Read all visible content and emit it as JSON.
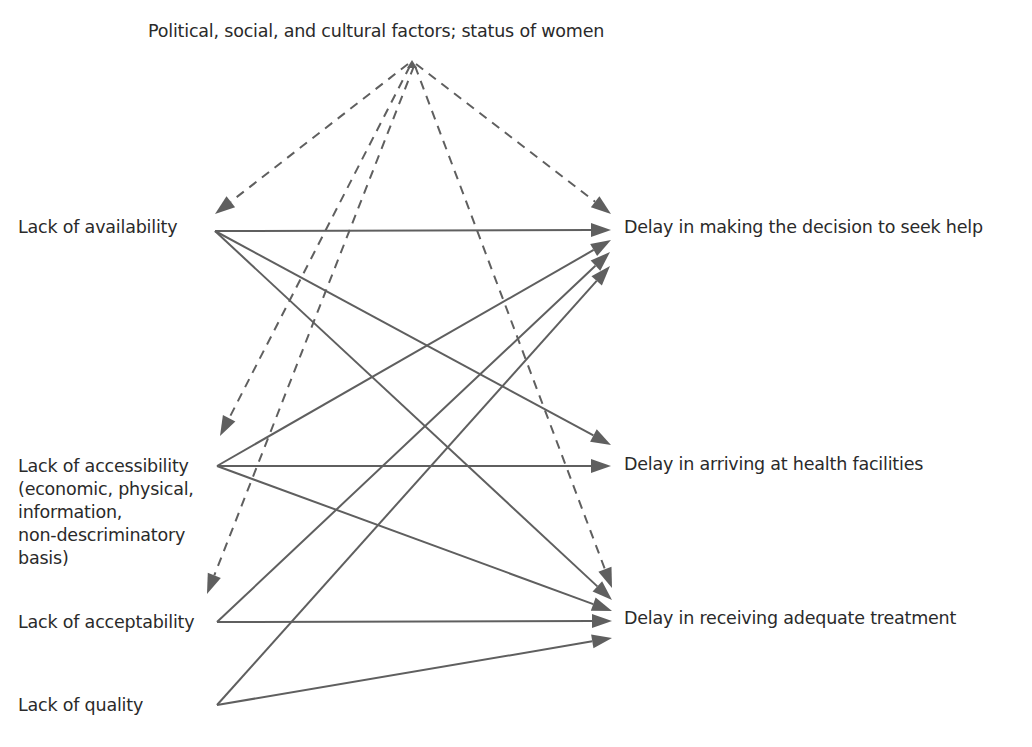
{
  "diagram": {
    "colors": {
      "edge": "#5f5f5f",
      "text": "#2a2a2a",
      "background": "#ffffff"
    },
    "top": {
      "id": "factors",
      "label": "Political, social, and cultural factors; status of women",
      "x": 148,
      "y": 20,
      "anchor": [
        412,
        62
      ]
    },
    "left_nodes": [
      {
        "id": "availability",
        "label": "Lack of availability",
        "x": 18,
        "y": 216,
        "anchor": [
          215,
          231
        ]
      },
      {
        "id": "accessibility",
        "label": "Lack of accessibility\n(economic, physical,\ninformation,\nnon-descriminatory\nbasis)",
        "x": 18,
        "y": 455,
        "anchor": [
          217,
          466
        ]
      },
      {
        "id": "acceptability",
        "label": "Lack of acceptability",
        "x": 18,
        "y": 611,
        "anchor": [
          217,
          622
        ]
      },
      {
        "id": "quality",
        "label": "Lack of quality",
        "x": 18,
        "y": 694,
        "anchor": [
          217,
          705
        ]
      }
    ],
    "right_nodes": [
      {
        "id": "decision",
        "label": "Delay in making the decision to seek help",
        "x": 624,
        "y": 216
      },
      {
        "id": "arrival",
        "label": "Delay in arriving at health facilities",
        "x": 624,
        "y": 453
      },
      {
        "id": "treatment",
        "label": "Delay in receiving adequate treatment",
        "x": 624,
        "y": 607
      }
    ],
    "edges": [
      {
        "from": "factors",
        "to": "availability",
        "style": "dashed",
        "p1": [
          408,
          64
        ],
        "p2": [
          215,
          214
        ]
      },
      {
        "from": "factors",
        "to": "accessibility",
        "style": "dashed",
        "p1": [
          410,
          66
        ],
        "p2": [
          220,
          436
        ]
      },
      {
        "from": "factors",
        "to": "acceptability",
        "style": "dashed",
        "p1": [
          414,
          66
        ],
        "p2": [
          207,
          594
        ]
      },
      {
        "from": "factors",
        "to": "decision",
        "style": "dashed",
        "p1": [
          416,
          64
        ],
        "p2": [
          611,
          214
        ]
      },
      {
        "from": "factors",
        "to": "treatment",
        "style": "dashed",
        "p1": [
          415,
          66
        ],
        "p2": [
          612,
          588
        ]
      },
      {
        "from": "availability",
        "to": "decision",
        "style": "solid",
        "p1": [
          215,
          231
        ],
        "p2": [
          611,
          230
        ]
      },
      {
        "from": "availability",
        "to": "arrival",
        "style": "solid",
        "p1": [
          215,
          231
        ],
        "p2": [
          611,
          445
        ]
      },
      {
        "from": "availability",
        "to": "treatment",
        "style": "solid",
        "p1": [
          215,
          231
        ],
        "p2": [
          612,
          600
        ]
      },
      {
        "from": "accessibility",
        "to": "decision",
        "style": "solid",
        "p1": [
          217,
          466
        ],
        "p2": [
          611,
          240
        ]
      },
      {
        "from": "accessibility",
        "to": "arrival",
        "style": "solid",
        "p1": [
          217,
          466
        ],
        "p2": [
          611,
          466
        ]
      },
      {
        "from": "accessibility",
        "to": "treatment",
        "style": "solid",
        "p1": [
          217,
          466
        ],
        "p2": [
          612,
          611
        ]
      },
      {
        "from": "acceptability",
        "to": "decision",
        "style": "solid",
        "p1": [
          217,
          622
        ],
        "p2": [
          610,
          252
        ]
      },
      {
        "from": "acceptability",
        "to": "treatment",
        "style": "solid",
        "p1": [
          217,
          622
        ],
        "p2": [
          612,
          621
        ]
      },
      {
        "from": "quality",
        "to": "decision",
        "style": "solid",
        "p1": [
          217,
          705
        ],
        "p2": [
          610,
          266
        ]
      },
      {
        "from": "quality",
        "to": "treatment",
        "style": "solid",
        "p1": [
          217,
          705
        ],
        "p2": [
          612,
          638
        ]
      }
    ],
    "source_arrowhead": {
      "tip": [
        412,
        60
      ],
      "direction": "up"
    }
  }
}
